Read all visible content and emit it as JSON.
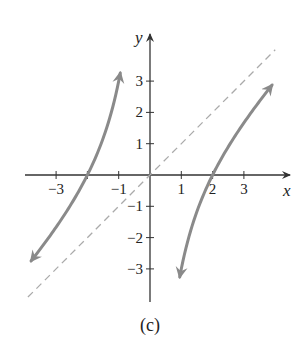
{
  "chart_data": {
    "type": "line",
    "title": "",
    "caption": "(c)",
    "xlabel": "x",
    "ylabel": "y",
    "xlim": [
      -4,
      4.5
    ],
    "ylim": [
      -4,
      4.5
    ],
    "grid": false,
    "x_ticks": [
      -3,
      -2,
      -1,
      1,
      2,
      3
    ],
    "x_tick_labels": [
      "−3",
      "−1",
      "1",
      "2",
      "3"
    ],
    "x_tick_labels_at": [
      -3,
      -1,
      1,
      2,
      3
    ],
    "y_ticks": [
      3,
      2,
      1,
      -1,
      -2,
      -3
    ],
    "y_tick_labels": [
      "3",
      "2",
      "1",
      "−1",
      "−2",
      "−3"
    ],
    "series": [
      {
        "name": "f(x) = x - 4/x (left branch, x < 0)",
        "style": "solid",
        "color": "#8a8a8a",
        "arrows": "both",
        "x": [
          -3.8,
          -3.5,
          -3.0,
          -2.5,
          -2.0,
          -1.6,
          -1.3,
          -1.1,
          -0.95
        ],
        "y": [
          -2.75,
          -2.36,
          -1.67,
          -0.9,
          0.0,
          0.9,
          1.78,
          2.54,
          3.26
        ]
      },
      {
        "name": "f(x) = x - 4/x (right branch, x > 0)",
        "style": "solid",
        "color": "#8a8a8a",
        "arrows": "both",
        "x": [
          0.95,
          1.1,
          1.3,
          1.6,
          2.0,
          2.5,
          3.0,
          3.5,
          3.9
        ],
        "y": [
          -3.26,
          -2.54,
          -1.78,
          -0.9,
          0.0,
          0.9,
          1.67,
          2.36,
          2.87
        ]
      },
      {
        "name": "slant asymptote y = x",
        "style": "dashed",
        "color": "#aaaaaa",
        "x": [
          -3.9,
          4.0
        ],
        "y": [
          -3.9,
          4.0
        ]
      }
    ],
    "vertical_asymptote": 0
  }
}
